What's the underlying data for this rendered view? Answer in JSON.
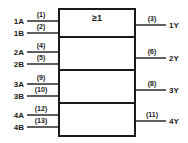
{
  "diagram": {
    "gate_symbol": "≥1",
    "colors": {
      "ink": "#1a1a1a",
      "background": "#ffffff"
    },
    "body": {
      "x": 59,
      "y": 9,
      "width": 76,
      "height": 127,
      "dividers_y": [
        37,
        70,
        103
      ]
    },
    "gates": [
      {
        "index": 1,
        "inputs": [
          {
            "name": "1A",
            "pin": "(1)",
            "y": 21
          },
          {
            "name": "1B",
            "pin": "(2)",
            "y": 33
          }
        ],
        "output": {
          "name": "1Y",
          "pin": "(3)",
          "y": 25
        }
      },
      {
        "index": 2,
        "inputs": [
          {
            "name": "2A",
            "pin": "(4)",
            "y": 52
          },
          {
            "name": "2B",
            "pin": "(5)",
            "y": 64
          }
        ],
        "output": {
          "name": "2Y",
          "pin": "(6)",
          "y": 58
        }
      },
      {
        "index": 3,
        "inputs": [
          {
            "name": "3A",
            "pin": "(9)",
            "y": 84
          },
          {
            "name": "3B",
            "pin": "(10)",
            "y": 96
          }
        ],
        "output": {
          "name": "3Y",
          "pin": "(8)",
          "y": 90
        }
      },
      {
        "index": 4,
        "inputs": [
          {
            "name": "4A",
            "pin": "(12)",
            "y": 115
          },
          {
            "name": "4B",
            "pin": "(13)",
            "y": 127
          }
        ],
        "output": {
          "name": "4Y",
          "pin": "(11)",
          "y": 121
        }
      }
    ]
  }
}
